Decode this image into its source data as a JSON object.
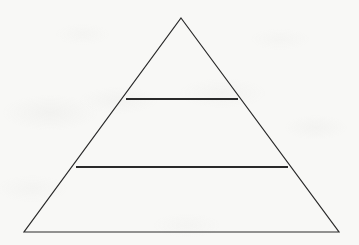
{
  "figure": {
    "kind": "pyramid-diagram",
    "title": "",
    "caption": "",
    "background_color": "#f8f8f6",
    "line_color": "#2a2a2a",
    "line_width": 1.2,
    "width": 359,
    "height": 245
  },
  "chart_data": {
    "type": "pie",
    "subtype": "pyramid",
    "title": "",
    "subtitle": "",
    "xlabel": "",
    "ylabel": "",
    "grid": false,
    "legend": "none",
    "annotations": [],
    "note": "Blank three-tier pyramid outline; no text labels, numbers or shading are printed in any tier.",
    "geometry": {
      "apex": [
        181,
        18
      ],
      "base_left": [
        24,
        232
      ],
      "base_right": [
        339,
        232
      ],
      "divider_upper_y": 99,
      "divider_lower_y": 167,
      "divider_upper_x": [
        126,
        238
      ],
      "divider_lower_x": [
        76,
        288
      ]
    },
    "categories": [
      "Top tier",
      "Middle tier",
      "Bottom tier"
    ],
    "values": [
      33.1,
      31.5,
      30.1
    ],
    "tiers": [
      {
        "index": 1,
        "position": "top",
        "label": "",
        "value": null,
        "top_y": 18,
        "bottom_y": 99,
        "height_px": 81,
        "top_width_px": 0,
        "bottom_width_px": 112,
        "fill": "none"
      },
      {
        "index": 2,
        "position": "middle",
        "label": "",
        "value": null,
        "top_y": 99,
        "bottom_y": 167,
        "height_px": 68,
        "top_width_px": 112,
        "bottom_width_px": 212,
        "fill": "none"
      },
      {
        "index": 3,
        "position": "bottom",
        "label": "",
        "value": null,
        "top_y": 167,
        "bottom_y": 232,
        "height_px": 65,
        "top_width_px": 212,
        "bottom_width_px": 315,
        "fill": "none"
      }
    ]
  }
}
